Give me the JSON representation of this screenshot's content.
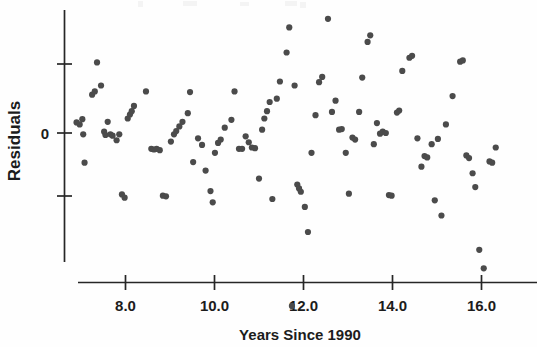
{
  "figure": {
    "type": "scatter-plot",
    "background_color": "#ffffff",
    "point_color": "#4b4b4b",
    "axis_color": "#262626"
  },
  "axes": {
    "y_axis_label": "Residuals",
    "y_zero_label": "0",
    "x_axis_title": "Years Since 1990",
    "x_tick_labels": [
      "8.0",
      "10.0",
      "12.0",
      "14.0",
      "16.0"
    ],
    "x_tick_values": [
      8.0,
      10.0,
      12.0,
      14.0,
      16.0
    ],
    "y_tick_labels": [
      "",
      "0",
      ""
    ],
    "y_tick_values": [
      1,
      0,
      -1
    ]
  },
  "chart_data": {
    "type": "scatter",
    "title": "",
    "subtitle": "",
    "xlabel": "Years Since 1990",
    "ylabel": "Residuals",
    "xlim": [
      6.7,
      16.9
    ],
    "ylim": [
      -2.85,
      1.85
    ],
    "grid": false,
    "legend": false,
    "xticks": [
      8.0,
      10.0,
      12.0,
      14.0,
      16.0
    ],
    "yticks": [
      1.0,
      0.0,
      -1.0
    ],
    "ytick_labels": [
      "",
      "0",
      ""
    ],
    "n_points": 124,
    "series": [
      {
        "name": "residuals",
        "color": "#4b4b4b",
        "marker": "circle",
        "points": [
          [
            6.9,
            0.16
          ],
          [
            6.97,
            0.13
          ],
          [
            7.03,
            0.21
          ],
          [
            7.05,
            -0.02
          ],
          [
            7.08,
            -0.45
          ],
          [
            7.25,
            0.58
          ],
          [
            7.31,
            0.63
          ],
          [
            7.36,
            1.07
          ],
          [
            7.45,
            0.72
          ],
          [
            7.52,
            0.02
          ],
          [
            7.55,
            -0.03
          ],
          [
            7.6,
            0.17
          ],
          [
            7.66,
            -0.02
          ],
          [
            7.71,
            -0.04
          ],
          [
            7.8,
            -0.11
          ],
          [
            7.86,
            -0.02
          ],
          [
            7.92,
            -0.93
          ],
          [
            7.98,
            -0.98
          ],
          [
            8.05,
            0.22
          ],
          [
            8.1,
            0.28
          ],
          [
            8.14,
            0.33
          ],
          [
            8.19,
            0.41
          ],
          [
            8.46,
            0.63
          ],
          [
            8.58,
            -0.24
          ],
          [
            8.64,
            -0.25
          ],
          [
            8.7,
            -0.24
          ],
          [
            8.77,
            -0.26
          ],
          [
            8.84,
            -0.95
          ],
          [
            8.91,
            -0.96
          ],
          [
            9.02,
            -0.13
          ],
          [
            9.09,
            -0.02
          ],
          [
            9.14,
            0.03
          ],
          [
            9.21,
            0.1
          ],
          [
            9.28,
            0.17
          ],
          [
            9.4,
            0.3
          ],
          [
            9.45,
            0.62
          ],
          [
            9.52,
            -0.44
          ],
          [
            9.63,
            -0.08
          ],
          [
            9.72,
            -0.18
          ],
          [
            9.8,
            -0.57
          ],
          [
            9.91,
            -0.88
          ],
          [
            9.96,
            -1.05
          ],
          [
            10.01,
            -0.3
          ],
          [
            10.08,
            -0.15
          ],
          [
            10.14,
            -0.1
          ],
          [
            10.23,
            0.08
          ],
          [
            10.38,
            0.2
          ],
          [
            10.45,
            0.63
          ],
          [
            10.55,
            -0.24
          ],
          [
            10.62,
            -0.24
          ],
          [
            10.7,
            -0.05
          ],
          [
            10.77,
            -0.14
          ],
          [
            10.84,
            -0.22
          ],
          [
            10.91,
            -0.23
          ],
          [
            11.0,
            -0.69
          ],
          [
            11.07,
            0.05
          ],
          [
            11.12,
            0.22
          ],
          [
            11.18,
            0.33
          ],
          [
            11.24,
            0.47
          ],
          [
            11.3,
            -1.0
          ],
          [
            11.4,
            0.52
          ],
          [
            11.47,
            0.78
          ],
          [
            11.62,
            1.22
          ],
          [
            11.68,
            1.6
          ],
          [
            11.74,
            -2.62
          ],
          [
            11.8,
            0.72
          ],
          [
            11.86,
            -0.78
          ],
          [
            11.9,
            -0.84
          ],
          [
            11.94,
            -0.89
          ],
          [
            12.03,
            -1.12
          ],
          [
            12.1,
            -1.5
          ],
          [
            12.18,
            -0.3
          ],
          [
            12.27,
            0.27
          ],
          [
            12.35,
            0.77
          ],
          [
            12.42,
            0.85
          ],
          [
            12.55,
            1.73
          ],
          [
            12.64,
            0.32
          ],
          [
            12.72,
            0.49
          ],
          [
            12.8,
            0.05
          ],
          [
            12.86,
            0.06
          ],
          [
            12.95,
            -0.3
          ],
          [
            13.02,
            -0.92
          ],
          [
            13.1,
            -0.07
          ],
          [
            13.16,
            -0.1
          ],
          [
            13.25,
            0.32
          ],
          [
            13.32,
            0.84
          ],
          [
            13.44,
            1.38
          ],
          [
            13.5,
            1.48
          ],
          [
            13.58,
            -0.17
          ],
          [
            13.65,
            0.15
          ],
          [
            13.72,
            -0.01
          ],
          [
            13.78,
            0.02
          ],
          [
            13.85,
            0.0
          ],
          [
            13.92,
            -0.94
          ],
          [
            13.98,
            -0.95
          ],
          [
            14.1,
            0.31
          ],
          [
            14.15,
            0.34
          ],
          [
            14.22,
            0.94
          ],
          [
            14.38,
            1.14
          ],
          [
            14.44,
            1.17
          ],
          [
            14.56,
            -0.08
          ],
          [
            14.65,
            -0.51
          ],
          [
            14.72,
            -0.35
          ],
          [
            14.78,
            -0.37
          ],
          [
            14.88,
            -0.17
          ],
          [
            14.95,
            -1.02
          ],
          [
            15.02,
            -0.09
          ],
          [
            15.1,
            -1.25
          ],
          [
            15.2,
            0.13
          ],
          [
            15.35,
            0.56
          ],
          [
            15.52,
            1.08
          ],
          [
            15.58,
            1.1
          ],
          [
            15.66,
            -0.34
          ],
          [
            15.72,
            -0.38
          ],
          [
            15.8,
            -0.61
          ],
          [
            15.86,
            -0.82
          ],
          [
            15.95,
            -1.77
          ],
          [
            16.05,
            -2.05
          ],
          [
            16.18,
            -0.43
          ],
          [
            16.24,
            -0.45
          ],
          [
            16.32,
            -0.22
          ]
        ]
      }
    ]
  }
}
